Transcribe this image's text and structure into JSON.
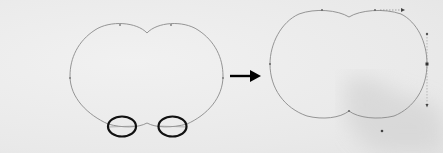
{
  "figure": {
    "colors": {
      "background": "#ececec",
      "path_stroke": "#8a8a8a",
      "highlight_ellipse": "#111111",
      "arrow": "#000000",
      "handle": "#555555",
      "shadow_smudge": "#cfcfcf"
    },
    "before_shape": {
      "label": "",
      "circled_points": 2
    },
    "arrow": {
      "direction": "right"
    },
    "after_shape": {
      "label": "",
      "handles_visible": true
    }
  }
}
